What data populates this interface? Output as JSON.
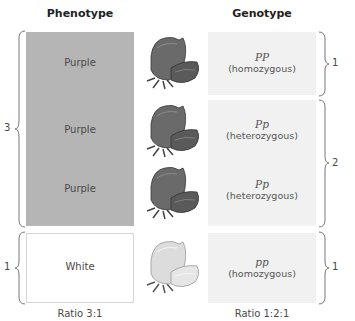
{
  "headers": {
    "phenotype": "Phenotype",
    "genotype": "Genotype"
  },
  "phenotypes": [
    {
      "label": "Purple",
      "color": "#b5b5b5"
    },
    {
      "label": "Purple",
      "color": "#b5b5b5"
    },
    {
      "label": "Purple",
      "color": "#b5b5b5"
    },
    {
      "label": "White",
      "color": "#ffffff"
    }
  ],
  "flowers": [
    {
      "type": "purple-flower-icon"
    },
    {
      "type": "purple-flower-icon"
    },
    {
      "type": "purple-flower-icon"
    },
    {
      "type": "white-flower-icon"
    }
  ],
  "genotypes": [
    {
      "symbol": "PP",
      "description": "(homozygous)"
    },
    {
      "symbol": "Pp",
      "description": "(heterozygous)"
    },
    {
      "symbol": "Pp",
      "description": "(heterozygous)"
    },
    {
      "symbol": "pp",
      "description": "(homozygous)"
    }
  ],
  "phenotype_groups": [
    {
      "count": "3"
    },
    {
      "count": "1"
    }
  ],
  "genotype_groups": [
    {
      "count": "1"
    },
    {
      "count": "2"
    },
    {
      "count": "1"
    }
  ],
  "ratios": {
    "phenotype": "Ratio 3:1",
    "genotype": "Ratio 1:2:1"
  }
}
